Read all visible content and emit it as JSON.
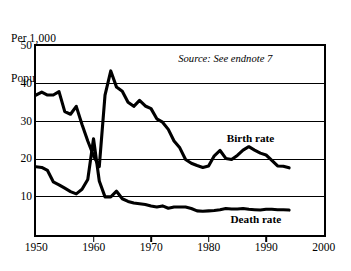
{
  "figure": {
    "axis_title_lines": [
      "Per 1,000",
      "Population"
    ],
    "source_note": "Source: See endnote 7",
    "birth_label": "Birth rate",
    "death_label": "Death rate",
    "line_color": "#000000",
    "background_color": "#ffffff"
  },
  "chart_data": {
    "type": "line",
    "title": "",
    "subtitle": "",
    "xlabel": "",
    "ylabel": "Per 1,000 Population",
    "xlim": [
      1950,
      2000
    ],
    "ylim": [
      0,
      50
    ],
    "xticks": [
      1950,
      1960,
      1970,
      1980,
      1990,
      2000
    ],
    "yticks": [
      10,
      20,
      30,
      40,
      50
    ],
    "grid": "horizontal",
    "legend_position": "inline-annotations",
    "annotations": [
      {
        "text": "Source: See endnote 7",
        "x": 1990,
        "y": 46.5,
        "style": "italic"
      },
      {
        "text": "Birth rate",
        "x": 1988,
        "y": 25.5,
        "style": "bold"
      },
      {
        "text": "Death rate",
        "x": 1989,
        "y": 4.0,
        "style": "bold"
      }
    ],
    "series": [
      {
        "name": "Birth rate",
        "x": [
          1950,
          1951,
          1952,
          1953,
          1954,
          1955,
          1956,
          1957,
          1958,
          1959,
          1960,
          1961,
          1962,
          1963,
          1964,
          1965,
          1966,
          1967,
          1968,
          1969,
          1970,
          1971,
          1972,
          1973,
          1974,
          1975,
          1976,
          1977,
          1978,
          1979,
          1980,
          1981,
          1982,
          1983,
          1984,
          1985,
          1986,
          1987,
          1988,
          1989,
          1990,
          1991,
          1992,
          1993,
          1994
        ],
        "values": [
          37.0,
          37.8,
          37.0,
          37.0,
          37.9,
          32.6,
          31.9,
          34.0,
          29.2,
          24.8,
          20.9,
          18.0,
          37.0,
          43.4,
          39.1,
          38.0,
          35.1,
          34.0,
          35.6,
          34.1,
          33.4,
          30.7,
          29.8,
          27.9,
          24.8,
          23.0,
          19.9,
          18.9,
          18.3,
          17.8,
          18.2,
          20.9,
          22.3,
          20.2,
          19.9,
          21.0,
          22.4,
          23.3,
          22.4,
          21.6,
          21.1,
          19.7,
          18.2,
          18.1,
          17.7
        ],
        "units": "per 1,000 population"
      },
      {
        "name": "Death rate",
        "x": [
          1950,
          1951,
          1952,
          1953,
          1954,
          1955,
          1956,
          1957,
          1958,
          1959,
          1960,
          1961,
          1962,
          1963,
          1964,
          1965,
          1966,
          1967,
          1968,
          1969,
          1970,
          1971,
          1972,
          1973,
          1974,
          1975,
          1976,
          1977,
          1978,
          1979,
          1980,
          1981,
          1982,
          1983,
          1984,
          1985,
          1986,
          1987,
          1988,
          1989,
          1990,
          1991,
          1992,
          1993,
          1994
        ],
        "values": [
          18.0,
          17.8,
          17.0,
          14.0,
          13.2,
          12.3,
          11.4,
          10.8,
          12.0,
          14.6,
          25.4,
          14.2,
          10.0,
          10.0,
          11.5,
          9.5,
          8.8,
          8.4,
          8.2,
          8.0,
          7.6,
          7.3,
          7.6,
          7.0,
          7.3,
          7.3,
          7.3,
          6.9,
          6.3,
          6.2,
          6.3,
          6.4,
          6.6,
          6.9,
          6.8,
          6.8,
          6.9,
          6.7,
          6.6,
          6.5,
          6.7,
          6.7,
          6.6,
          6.6,
          6.5
        ],
        "units": "per 1,000 population"
      }
    ]
  }
}
